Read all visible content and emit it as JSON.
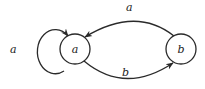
{
  "diagram": {
    "type": "state-machine",
    "colors": {
      "stroke": "#2a2a2a",
      "text": "#222222",
      "background": "#ffffff"
    },
    "nodes": [
      {
        "id": "a",
        "label": "a",
        "cx": 75,
        "cy": 49,
        "r": 15
      },
      {
        "id": "b",
        "label": "b",
        "cx": 181,
        "cy": 49,
        "r": 15
      }
    ],
    "edges": [
      {
        "from": "a",
        "to": "a",
        "label": "a",
        "kind": "self-loop"
      },
      {
        "from": "b",
        "to": "a",
        "label": "a",
        "kind": "arc-top"
      },
      {
        "from": "a",
        "to": "b",
        "label": "b",
        "kind": "arc-bottom"
      }
    ]
  }
}
